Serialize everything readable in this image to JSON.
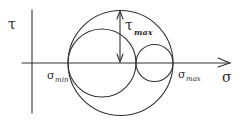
{
  "diagram": {
    "axes": {
      "horizontal_label": "σ",
      "vertical_label": "τ"
    },
    "labels": {
      "sigma_min": {
        "symbol": "σ",
        "subscript": "min"
      },
      "sigma_max": {
        "symbol": "σ",
        "subscript": "max"
      },
      "tau_max": {
        "symbol": "τ",
        "subscript": "max"
      }
    },
    "circles": [
      {
        "name": "outer-circle",
        "from": "σmin",
        "to": "σmax"
      },
      {
        "name": "left-circle",
        "from": "σmin",
        "to": "σmid"
      },
      {
        "name": "right-circle",
        "from": "σmid",
        "to": "σmax"
      }
    ],
    "colors": {
      "stroke": "#333333",
      "background": "#ffffff"
    }
  }
}
